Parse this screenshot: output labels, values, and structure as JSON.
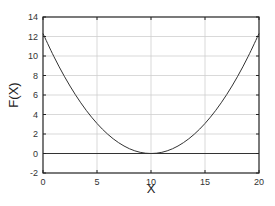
{
  "chart_data": {
    "type": "line",
    "title": "",
    "xlabel": "X",
    "ylabel": "F(X)",
    "xlim": [
      0,
      20
    ],
    "ylim": [
      -2,
      14
    ],
    "xticks": [
      0,
      5,
      10,
      15,
      20
    ],
    "yticks": [
      -2,
      0,
      2,
      4,
      6,
      8,
      10,
      12,
      14
    ],
    "grid": true,
    "legend": null,
    "series": [
      {
        "name": "F(X)",
        "color": "#333333",
        "x": [
          0,
          1,
          2,
          3,
          4,
          5,
          6,
          7,
          8,
          9,
          10,
          11,
          12,
          13,
          14,
          15,
          16,
          17,
          18,
          19,
          20
        ],
        "values": [
          12.3,
          9.96,
          7.87,
          6.03,
          4.43,
          3.08,
          1.97,
          1.11,
          0.49,
          0.12,
          0.0,
          0.12,
          0.49,
          1.11,
          1.97,
          3.08,
          4.43,
          6.03,
          7.87,
          9.96,
          12.3
        ]
      },
      {
        "name": "zero line",
        "color": "#333333",
        "x": [
          0,
          20
        ],
        "values": [
          0,
          0
        ]
      }
    ]
  },
  "colors": {
    "axis": "#222222",
    "grid": "#cfcfcf",
    "curve": "#333333",
    "background": "#ffffff"
  },
  "layout": {
    "plot_left": 43,
    "plot_top": 17,
    "plot_right": 259,
    "plot_bottom": 173
  }
}
